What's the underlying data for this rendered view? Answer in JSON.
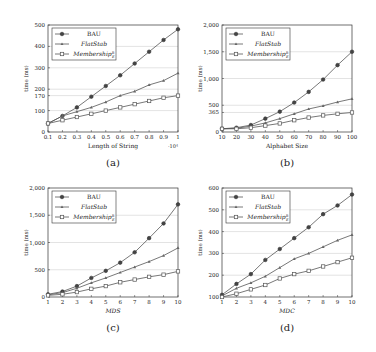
{
  "chart_data": [
    {
      "id": "a",
      "type": "line",
      "caption": "(a)",
      "xlabel": "Length of String",
      "x_multiplier": "·10⁴",
      "ylabel": "time (ms)",
      "x": [
        0.1,
        0.2,
        0.3,
        0.4,
        0.5,
        0.6,
        0.7,
        0.8,
        0.9,
        1
      ],
      "x_ticks": [
        "0.1",
        "0.2",
        "0.3",
        "0.4",
        "0.5",
        "0.6",
        "0.7",
        "0.8",
        "0.9",
        "1"
      ],
      "ylim": [
        0,
        500
      ],
      "y_ticks": [
        0,
        100,
        170,
        200,
        300,
        400,
        500
      ],
      "y_tick_labels": [
        "0",
        "100",
        "170",
        "200",
        "300",
        "400",
        "500"
      ],
      "grid": "horizontal",
      "legend_position": "upper left",
      "series": [
        {
          "name": "BAU",
          "marker": "filled-circle",
          "values": [
            40,
            75,
            115,
            165,
            215,
            265,
            320,
            375,
            430,
            480
          ]
        },
        {
          "name": "FlatStab",
          "marker": "triangle",
          "values": [
            40,
            75,
            95,
            115,
            140,
            170,
            190,
            220,
            240,
            275
          ]
        },
        {
          "name": "Membership",
          "marker": "square",
          "values": [
            40,
            55,
            70,
            85,
            100,
            115,
            130,
            145,
            160,
            170
          ]
        }
      ]
    },
    {
      "id": "b",
      "type": "line",
      "caption": "(b)",
      "xlabel": "Alphabet Size",
      "ylabel": "time (ms)",
      "x": [
        10,
        20,
        30,
        40,
        50,
        60,
        70,
        80,
        90,
        100
      ],
      "x_ticks": [
        "10",
        "20",
        "30",
        "40",
        "50",
        "60",
        "70",
        "80",
        "90",
        "100"
      ],
      "ylim": [
        0,
        2000
      ],
      "y_ticks": [
        0,
        365,
        500,
        1000,
        1500,
        2000
      ],
      "y_tick_labels": [
        "0",
        "365",
        "500",
        "1,000",
        "1,500",
        "2,000"
      ],
      "grid": "horizontal",
      "legend_position": "upper left",
      "series": [
        {
          "name": "BAU",
          "marker": "filled-circle",
          "values": [
            60,
            80,
            130,
            250,
            380,
            550,
            750,
            980,
            1250,
            1500
          ]
        },
        {
          "name": "FlatStab",
          "marker": "triangle",
          "values": [
            60,
            70,
            110,
            170,
            250,
            340,
            430,
            490,
            560,
            620
          ]
        },
        {
          "name": "Membership",
          "marker": "square",
          "values": [
            60,
            60,
            80,
            120,
            160,
            220,
            270,
            310,
            340,
            365
          ]
        }
      ]
    },
    {
      "id": "c",
      "type": "line",
      "caption": "(c)",
      "xlabel": "MDS",
      "ylabel": "time (ms)",
      "x": [
        1,
        2,
        3,
        4,
        5,
        6,
        7,
        8,
        9,
        10
      ],
      "x_ticks": [
        "1",
        "2",
        "3",
        "4",
        "5",
        "6",
        "7",
        "8",
        "9",
        "10"
      ],
      "ylim": [
        0,
        2000
      ],
      "y_ticks": [
        0,
        500,
        1000,
        1500,
        2000
      ],
      "y_tick_labels": [
        "0",
        "500",
        "1,000",
        "1,500",
        "2,000"
      ],
      "grid": "horizontal",
      "legend_position": "upper left",
      "series": [
        {
          "name": "BAU",
          "marker": "filled-circle",
          "values": [
            50,
            100,
            200,
            350,
            480,
            630,
            820,
            1080,
            1350,
            1700
          ]
        },
        {
          "name": "FlatStab",
          "marker": "triangle",
          "values": [
            40,
            80,
            160,
            260,
            350,
            450,
            550,
            650,
            760,
            900
          ]
        },
        {
          "name": "Membership",
          "marker": "square",
          "values": [
            30,
            50,
            90,
            150,
            200,
            270,
            320,
            370,
            410,
            470
          ]
        }
      ]
    },
    {
      "id": "d",
      "type": "line",
      "caption": "(d)",
      "xlabel": "MDC",
      "ylabel": "time (ms)",
      "x": [
        1,
        2,
        3,
        4,
        5,
        6,
        7,
        8,
        9,
        10
      ],
      "x_ticks": [
        "1",
        "2",
        "3",
        "4",
        "5",
        "6",
        "7",
        "8",
        "9",
        "10"
      ],
      "ylim": [
        100,
        600
      ],
      "y_ticks": [
        100,
        200,
        300,
        400,
        500,
        600
      ],
      "y_tick_labels": [
        "100",
        "200",
        "300",
        "400",
        "500",
        "600"
      ],
      "grid": "horizontal",
      "legend_position": "upper left",
      "series": [
        {
          "name": "BAU",
          "marker": "filled-circle",
          "values": [
            110,
            160,
            205,
            270,
            320,
            370,
            420,
            480,
            520,
            570
          ]
        },
        {
          "name": "FlatStab",
          "marker": "triangle",
          "values": [
            105,
            140,
            165,
            195,
            235,
            275,
            300,
            330,
            360,
            385
          ]
        },
        {
          "name": "Membership",
          "marker": "square",
          "values": [
            100,
            115,
            135,
            155,
            185,
            205,
            220,
            240,
            260,
            280
          ]
        }
      ]
    }
  ],
  "legend": {
    "bau": "BAU",
    "flatstab": "FlatStab",
    "membership": "Membership",
    "membership_sub": "E",
    "membership_sup": "R"
  },
  "colors": {
    "line": "#555555",
    "grid": "#d0d0d0",
    "axis": "#333333"
  }
}
